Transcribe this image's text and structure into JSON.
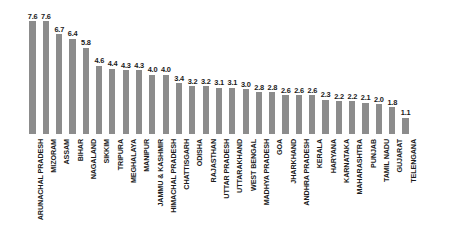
{
  "chart_data": {
    "type": "bar",
    "title": "",
    "subtitle": "",
    "xlabel": "",
    "ylabel": "",
    "ylim": [
      0,
      8.0
    ],
    "grid": false,
    "legend": false,
    "orientation": "vertical",
    "bar_color": "#8c8c8c",
    "background_color": "#ffffff",
    "label_color": "#1a1a1a",
    "categories": [
      "ARUNACHAL PRADESH",
      "MIZORAM",
      "ASSAM",
      "BIHAR",
      "NAGALAND",
      "SIKKIM",
      "TRIPURA",
      "MEGHALAYA",
      "MANIPUR",
      "JAMMU & KASHMIR",
      "HIMACHAL PRADESH",
      "CHATTISGARH",
      "ODISHA",
      "RAJASTHAN",
      "UTTAR PRADESH",
      "UTTARAKHAND",
      "WEST BENGAL",
      "MADHYA PRADESH",
      "GOA",
      "JHARKHAND",
      "ANDHRA PRADESH",
      "KERALA",
      "HARYANA",
      "KARNATAKA",
      "MAHARASHTRA",
      "PUNJAB",
      "TAMIL NADU",
      "GUJARAT",
      "TELENGANA"
    ],
    "values": [
      7.6,
      7.6,
      6.7,
      6.4,
      5.8,
      4.6,
      4.4,
      4.3,
      4.3,
      4.0,
      4.0,
      3.4,
      3.2,
      3.2,
      3.1,
      3.1,
      3.0,
      2.8,
      2.8,
      2.6,
      2.6,
      2.6,
      2.3,
      2.2,
      2.2,
      2.1,
      2.0,
      1.8,
      1.1
    ],
    "value_labels": [
      "7.6",
      "7.6",
      "6.7",
      "6.4",
      "5.8",
      "4.6",
      "4.4",
      "4.3",
      "4.3",
      "4.0",
      "4.0",
      "3.4",
      "3.2",
      "3.2",
      "3.1",
      "3.1",
      "3.0",
      "2.8",
      "2.8",
      "2.6",
      "2.6",
      "2.6",
      "2.3",
      "2.2",
      "2.2",
      "2.1",
      "2.0",
      "1.8",
      "1.1"
    ]
  }
}
